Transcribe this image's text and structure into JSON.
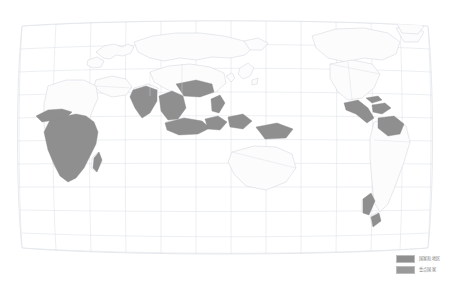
{
  "figure": {
    "type": "world-map",
    "projection": "robinson",
    "center_longitude": 120,
    "background_color": "#ffffff",
    "graticule_color": "#d9dde3",
    "coastline_color": "#c8ccd2",
    "land_fill": "#fcfcfd",
    "frame_color": "#dcdfe4"
  },
  "legend": {
    "position": "bottom-right",
    "items": [
      {
        "label": "国家和地区",
        "color": "#8f8f8f"
      },
      {
        "label": "重点国家",
        "color": "#9a9a9a"
      }
    ]
  },
  "map_data": {
    "highlighted_regions": [
      {
        "name": "sub-saharan-africa",
        "color": "#8f8f8f"
      },
      {
        "name": "south-asia",
        "color": "#8f8f8f"
      },
      {
        "name": "southeast-asia",
        "color": "#8f8f8f"
      },
      {
        "name": "indonesia-philippines",
        "color": "#8f8f8f"
      },
      {
        "name": "central-america-caribbean",
        "color": "#8f8f8f"
      },
      {
        "name": "new-zealand",
        "color": "#8f8f8f"
      },
      {
        "name": "madagascar",
        "color": "#8f8f8f"
      }
    ],
    "graticule_spacing_deg": {
      "lat": 20,
      "lon": 20
    }
  }
}
